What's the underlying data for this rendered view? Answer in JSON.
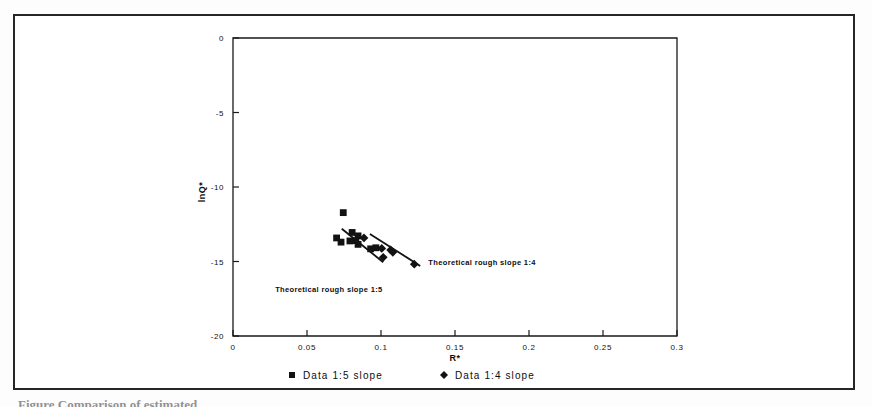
{
  "figure": {
    "caption_fragment": "Figure  Comparison of estimated"
  },
  "chart_data": {
    "type": "scatter",
    "title": "",
    "xlabel": "R*",
    "ylabel": "lnQ*",
    "xlim": [
      0,
      0.3
    ],
    "ylim": [
      -20,
      0
    ],
    "grid": false,
    "legend_position": "bottom",
    "xticks": [
      0,
      0.05,
      0.1,
      0.15,
      0.2,
      0.25,
      0.3
    ],
    "xtick_labels": [
      "0",
      "0.05",
      "0.1",
      "0.15",
      "0.2",
      "0.25",
      "0.3"
    ],
    "yticks": [
      0,
      -5,
      -10,
      -15,
      -20
    ],
    "ytick_labels": [
      "0",
      "-5",
      "-10",
      "-15",
      "-20"
    ],
    "series": [
      {
        "name": "Data 1:5 slope",
        "marker": "square",
        "color": "#121212",
        "points": [
          {
            "x": 0.0745,
            "y": -11.72
          },
          {
            "x": 0.07,
            "y": -13.42
          },
          {
            "x": 0.0805,
            "y": -13.05
          },
          {
            "x": 0.0845,
            "y": -13.28
          },
          {
            "x": 0.079,
            "y": -13.62
          },
          {
            "x": 0.083,
            "y": -13.6
          },
          {
            "x": 0.0845,
            "y": -13.85
          },
          {
            "x": 0.073,
            "y": -13.7
          },
          {
            "x": 0.093,
            "y": -14.15
          },
          {
            "x": 0.0965,
            "y": -14.08
          }
        ]
      },
      {
        "name": "Data 1:4 slope",
        "marker": "diamond",
        "color": "#121212",
        "points": [
          {
            "x": 0.0885,
            "y": -13.42
          },
          {
            "x": 0.1005,
            "y": -14.12
          },
          {
            "x": 0.1065,
            "y": -14.22
          },
          {
            "x": 0.108,
            "y": -14.38
          },
          {
            "x": 0.1015,
            "y": -14.72
          },
          {
            "x": 0.1225,
            "y": -15.18
          }
        ]
      }
    ],
    "trend_lines": [
      {
        "name": "Theoretical rough slope 1:5",
        "label": "Theoretical rough slope 1:5",
        "x0": 0.0735,
        "y0": -12.8,
        "x1": 0.1015,
        "y1": -15.05
      },
      {
        "name": "Theoretical rough slope 1:4",
        "label": "Theoretical rough slope 1:4",
        "x0": 0.0925,
        "y0": -13.15,
        "x1": 0.1265,
        "y1": -15.3
      }
    ],
    "annotations": [
      {
        "text": "Theoretical rough slope 1:5",
        "x": 0.0285,
        "y": -17.05
      },
      {
        "text": "Theoretical rough slope 1:4",
        "x": 0.132,
        "y": -15.25
      }
    ]
  },
  "legend": {
    "items": [
      {
        "label": "Data 1:5 slope",
        "marker": "square"
      },
      {
        "label": "Data 1:4 slope",
        "marker": "diamond"
      }
    ]
  }
}
